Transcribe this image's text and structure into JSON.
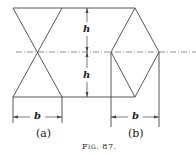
{
  "figure": {
    "caption": "Fig. 87.",
    "panels": [
      {
        "id": "a",
        "label": "(a)",
        "shape": "two triangles meeting at apex (hourglass)",
        "width_label": "b"
      },
      {
        "id": "b",
        "label": "(b)",
        "shape": "rhombus (diamond)",
        "width_label": "b"
      }
    ],
    "dimensions": {
      "upper_height_label": "h",
      "lower_height_label": "h"
    },
    "colors": {
      "line": "#444444",
      "background": "#ffffff"
    }
  }
}
